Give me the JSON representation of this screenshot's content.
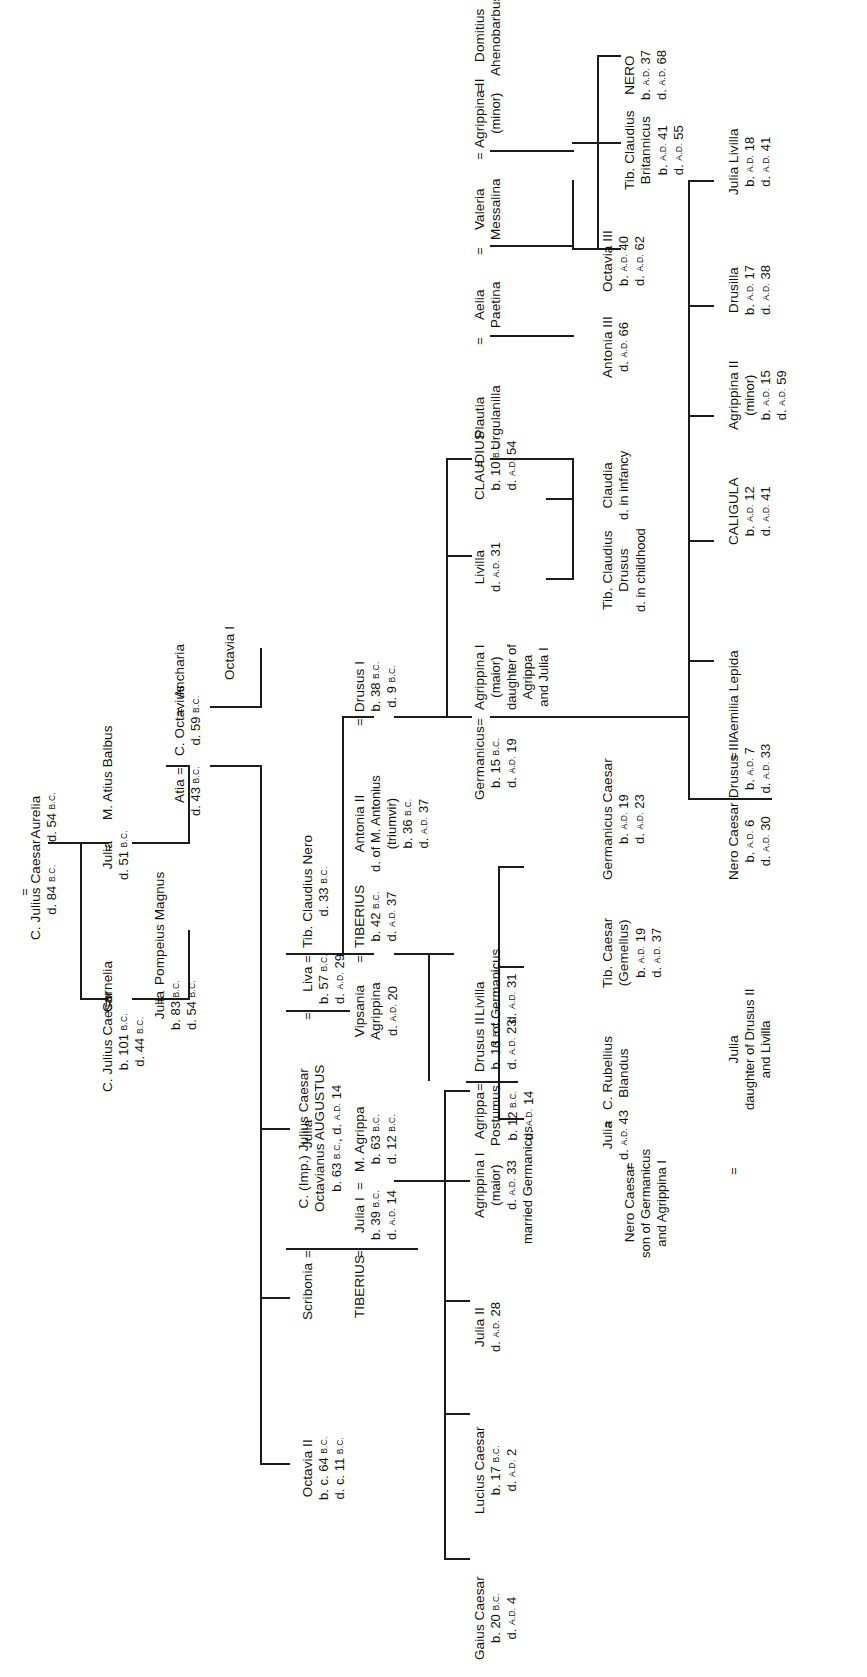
{
  "diagram": {
    "type": "genealogy-chart",
    "orientation": "rotated-90-ccw",
    "line_color": "#1b1b1b",
    "background": "#ffffff"
  },
  "union_marker": "=",
  "people": {
    "c_julius_caesar_elder": {
      "name": "C. Julius Caesar",
      "d": "d. 84 B.C."
    },
    "aurelia": {
      "name": "Aurelia",
      "d": "d. 54 B.C."
    },
    "julia_d51": {
      "name": "Julia",
      "d": "d. 51 B.C."
    },
    "m_atius_balbus": {
      "name": "M. Atius Balbus"
    },
    "c_julius_caesar": {
      "name": "C. Julius Caesar",
      "b": "b. 101 B.C.",
      "d": "d. 44 B.C."
    },
    "cornelia": {
      "name": "Cornelia"
    },
    "julia_b83": {
      "name": "Julia",
      "b": "b. 83 B.C.",
      "d": "d. 54 B.C."
    },
    "pompeius_magnus": {
      "name": "Pompeius Magnus"
    },
    "atia": {
      "name": "Atia",
      "d": "d. 43 B.C."
    },
    "c_octavius": {
      "name": "C. Octavius",
      "d": "d. 59 B.C."
    },
    "ancharia": {
      "name": "Ancharia"
    },
    "octavia_i": {
      "name": "Octavia I"
    },
    "julia_plain": {
      "name": "Julia"
    },
    "octavia_ii": {
      "name": "Octavia II",
      "b": "b. c. 64 B.C.",
      "d": "d. c. 11 B.C."
    },
    "scribonia": {
      "name": "Scribonia"
    },
    "augustus": {
      "name_line1": "C. (Imp.) Julius Caesar",
      "name_line2": "Octavianus  AUGUSTUS",
      "dates": "b. 63 B.C., d. A.D. 14"
    },
    "livia": {
      "name": "Liva",
      "b": "b. 57 B.C.",
      "d": "d. A.D. 29"
    },
    "tib_claudius_nero": {
      "name": "Tib. Claudius Nero",
      "d": "d. 33 B.C."
    },
    "tiberius_label": {
      "name": "TIBERIUS"
    },
    "julia_i": {
      "name": "Julia I",
      "b": "b. 39 B.C.",
      "d": "d. A.D. 14"
    },
    "m_agrippa": {
      "name": "M. Agrippa",
      "b": "b. 63 B.C.",
      "d": "d. 12 B.C."
    },
    "gaius_caesar": {
      "name": "Gaius Caesar",
      "b": "b. 20 B.C.",
      "d": "d. A.D. 4"
    },
    "lucius_caesar": {
      "name": "Lucius Caesar",
      "b": "b. 17 B.C.",
      "d": "d. A.D. 2"
    },
    "julia_ii": {
      "name": "Julia II",
      "d": "d. A.D. 28"
    },
    "agrippina_i": {
      "name": "Agrippina I",
      "sub1": "(maior)",
      "d": "d. A.D. 33",
      "sub2": "married Germanicus"
    },
    "agrippa_postumus": {
      "name1": "Agrippa",
      "name2": "Postumus",
      "b": "b. 12 B.C.",
      "d": "d. A.D. 14"
    },
    "vipsania_agrippina": {
      "name1": "Vipsania",
      "name2": "Agrippina",
      "d": "d. A.D. 20"
    },
    "tiberius": {
      "name": "TIBERIUS",
      "b": "b. 42 B.C.",
      "d": "d. A.D. 37"
    },
    "antonia_ii": {
      "name": "Antonia II",
      "sub1": "d. of M. Antonius",
      "sub2": "(triumvir)",
      "b": "b. 36 B.C.",
      "d": "d. A.D. 37"
    },
    "drusus_i": {
      "name": "Drusus I",
      "b": "b. 38 B.C.",
      "d": "d. 9 B.C."
    },
    "drusus_ii": {
      "name": "Drusus II",
      "b": "b. 13 B.C.",
      "d": "d. A.D. 23"
    },
    "livilla_germ": {
      "name": "Livilla",
      "sub1": "d. of Germanicus",
      "d": "d. A.D. 31"
    },
    "germanicus": {
      "name": "Germanicus",
      "b": "b. 15 B.C.",
      "d": "d. A.D. 19"
    },
    "agrippina_i_major": {
      "name": "Agrippina I",
      "sub1": "(maior)",
      "sub2": "daughter of",
      "sub3": "Agrippa",
      "sub4": "and Julia I"
    },
    "livilla": {
      "name": "Livilla",
      "d": "d. A.D. 31"
    },
    "claudius": {
      "name": "CLAUDIUS",
      "b": "b. 10 B.C.",
      "d": "d. A.D. 54"
    },
    "plautia_urgulanilla": {
      "name1": "Plautia",
      "name2": "Urgulanilla"
    },
    "aelia_paetina": {
      "name1": "Aelia",
      "name2": "Paetina"
    },
    "valeria_messalina": {
      "name1": "Valeria",
      "name2": "Messalina"
    },
    "agrippina_ii_minor_top": {
      "name": "Agrippina II",
      "sub1": "(minor)"
    },
    "domitius_ahenobarbus": {
      "name1": "Domitius",
      "name2": "Ahenobarbus"
    },
    "tib_claudius_drusus": {
      "name1": "Tib. Claudius",
      "name2": "Drusus",
      "note": "d. in childhood"
    },
    "claudia": {
      "name": "Claudia",
      "note": "d. in infancy"
    },
    "antonia_iii": {
      "name": "Antonia III",
      "d": "d. A.D. 66"
    },
    "octavia_iii": {
      "name": "Octavia III",
      "b": "b. A.D. 40",
      "d": "d. A.D. 62"
    },
    "tib_claudius_britannicus": {
      "name1": "Tib. Claudius",
      "name2": "Britannicus",
      "b": "b. A.D. 41",
      "d": "d. A.D. 55"
    },
    "nero": {
      "name": "NERO",
      "b": "b. A.D. 37",
      "d": "d. A.D. 68"
    },
    "julia_rubellius": {
      "name": "Julia",
      "d": "d. A.D. 43"
    },
    "c_rubellius_blandus": {
      "name1": "C. Rubellius",
      "name2": "Blandus"
    },
    "tib_caesar_gemellus": {
      "name1": "Tib. Caesar",
      "name2": "(Gemellus)",
      "b": "b. A.D. 19",
      "d": "d. A.D. 37"
    },
    "germanicus_caesar": {
      "name": "Germanicus Caesar",
      "b": "b. A.D. 19",
      "d": "d. A.D. 23"
    },
    "nero_caesar_germ": {
      "name": "Nero Caesar",
      "sub1": "son of Germanicus",
      "sub2": "and Agrippina I"
    },
    "julia_drusus_ii": {
      "name": "Julia",
      "sub1": "daughter of Drusus II",
      "sub2": "and Livilla"
    },
    "nero_caesar": {
      "name": "Nero Caesar",
      "b": "b. A.D. 6",
      "d": "d. A.D. 30"
    },
    "drusus_iii": {
      "name": "Drusus III",
      "b": "b. A.D. 7",
      "d": "d. A.D. 33"
    },
    "aemilia_lepida": {
      "name": "Aemilia Lepida"
    },
    "caligula": {
      "name": "CALIGULA",
      "b": "b. A.D. 12",
      "d": "d. A.D. 41"
    },
    "agrippina_ii_minor": {
      "name": "Agrippina II",
      "sub1": "(minor)",
      "b": "b. A.D. 15",
      "d": "d. A.D. 59"
    },
    "drusilla": {
      "name": "Drusilla",
      "b": "b. A.D. 17",
      "d": "d. A.D. 38"
    },
    "julia_livilla": {
      "name": "Julia Livilla",
      "b": "b. A.D. 18",
      "d": "d. A.D. 41"
    }
  }
}
